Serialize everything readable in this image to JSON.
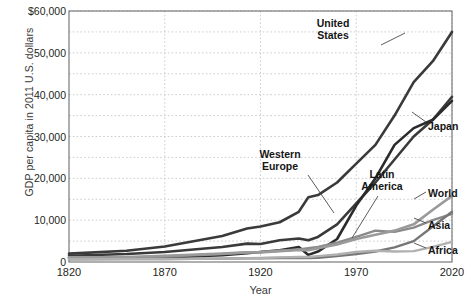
{
  "chart_data": {
    "type": "line",
    "title": "",
    "xlabel": "Year",
    "ylabel": "GDP per capita in 2011 U.S. dollars",
    "xlim": [
      1820,
      2020
    ],
    "ylim": [
      0,
      60000
    ],
    "grid": true,
    "legend_position": "inline-right-labels",
    "y_ticks": [
      {
        "value": 60000,
        "label": "$60,000"
      },
      {
        "value": 50000,
        "label": "50,000"
      },
      {
        "value": 40000,
        "label": "40,000"
      },
      {
        "value": 30000,
        "label": "30,000"
      },
      {
        "value": 20000,
        "label": "20,000"
      },
      {
        "value": 10000,
        "label": "10,000"
      },
      {
        "value": 0,
        "label": "0"
      }
    ],
    "y_minor_gridlines": [
      55000,
      45000,
      35000,
      25000,
      15000,
      5000
    ],
    "x_ticks": [
      {
        "value": 1820,
        "label": "1820"
      },
      {
        "value": 1870,
        "label": "1870"
      },
      {
        "value": 1920,
        "label": "1920"
      },
      {
        "value": 1970,
        "label": "1970"
      },
      {
        "value": 2020,
        "label": "2020"
      }
    ],
    "x": [
      1820,
      1850,
      1870,
      1900,
      1913,
      1920,
      1930,
      1940,
      1945,
      1950,
      1960,
      1970,
      1980,
      1990,
      2000,
      2010,
      2020
    ],
    "series": [
      {
        "name": "United States",
        "color": "#3a3a3a",
        "width": 2.6,
        "values": [
          2000,
          2700,
          3700,
          6200,
          8000,
          8500,
          9500,
          12000,
          15500,
          16000,
          19000,
          23500,
          28000,
          35000,
          43000,
          48000,
          55000
        ]
      },
      {
        "name": "Western Europe",
        "color": "#3a3a3a",
        "width": 2.6,
        "values": [
          1500,
          1900,
          2400,
          3600,
          4400,
          4300,
          5200,
          5600,
          5200,
          6000,
          9000,
          14000,
          19000,
          24500,
          30000,
          34000,
          39500
        ]
      },
      {
        "name": "Japan",
        "color": "#2b2b2b",
        "width": 2.6,
        "values": [
          900,
          1000,
          1100,
          1600,
          2100,
          2400,
          2800,
          3600,
          1700,
          2500,
          5500,
          13500,
          20000,
          28000,
          32000,
          34000,
          38500
        ]
      },
      {
        "name": "Latin America",
        "color": "#8a8a8a",
        "width": 2.4,
        "values": [
          1000,
          1100,
          1300,
          1900,
          2300,
          2400,
          2700,
          3000,
          3300,
          3600,
          4600,
          6000,
          7500,
          7200,
          8200,
          10000,
          11500
        ]
      },
      {
        "name": "World",
        "color": "#9a9a9a",
        "width": 2.6,
        "values": [
          1100,
          1200,
          1500,
          2000,
          2300,
          2300,
          2600,
          2900,
          2800,
          3300,
          4200,
          5500,
          6500,
          7500,
          9000,
          12500,
          15800
        ]
      },
      {
        "name": "Asia",
        "color": "#767676",
        "width": 2.4,
        "values": [
          650,
          680,
          720,
          800,
          900,
          900,
          950,
          1000,
          950,
          1000,
          1400,
          1900,
          2500,
          3500,
          5000,
          8500,
          12000
        ]
      },
      {
        "name": "Africa",
        "color": "#b0b0b0",
        "width": 2.4,
        "values": [
          650,
          680,
          700,
          800,
          900,
          950,
          1100,
          1200,
          1200,
          1400,
          1800,
          2400,
          2700,
          2500,
          2600,
          3600,
          4800
        ]
      }
    ],
    "annotations": [
      {
        "name": "United States",
        "text_lines": [
          "United",
          "States"
        ],
        "x_px": 333,
        "y_px": 17,
        "align": "center",
        "leader": {
          "x1": 381,
          "y1": 45,
          "x2": 405,
          "y2": 33
        }
      },
      {
        "name": "Japan",
        "text_lines": [
          "Japan"
        ],
        "x_px": 428,
        "y_px": 120,
        "align": "left",
        "leader": {
          "x1": 426,
          "y1": 122,
          "x2": 412,
          "y2": 112
        }
      },
      {
        "name": "Western Europe",
        "text_lines": [
          "Western",
          "Europe"
        ],
        "x_px": 280,
        "y_px": 148,
        "align": "center",
        "leader": {
          "x1": 308,
          "y1": 175,
          "x2": 334,
          "y2": 213
        }
      },
      {
        "name": "Latin America",
        "text_lines": [
          "Latin",
          "America"
        ],
        "x_px": 382,
        "y_px": 168,
        "align": "center",
        "leader": {
          "x1": 378,
          "y1": 196,
          "x2": 352,
          "y2": 238
        }
      },
      {
        "name": "World",
        "text_lines": [
          "World"
        ],
        "x_px": 428,
        "y_px": 187,
        "align": "left",
        "leader": {
          "x1": 426,
          "y1": 192,
          "x2": 414,
          "y2": 199
        }
      },
      {
        "name": "Asia",
        "text_lines": [
          "Asia"
        ],
        "x_px": 428,
        "y_px": 219,
        "align": "left",
        "leader": {
          "x1": 426,
          "y1": 223,
          "x2": 414,
          "y2": 218
        }
      },
      {
        "name": "Africa",
        "text_lines": [
          "Africa"
        ],
        "x_px": 428,
        "y_px": 244,
        "align": "left",
        "leader": {
          "x1": 426,
          "y1": 248,
          "x2": 414,
          "y2": 243
        }
      }
    ]
  }
}
